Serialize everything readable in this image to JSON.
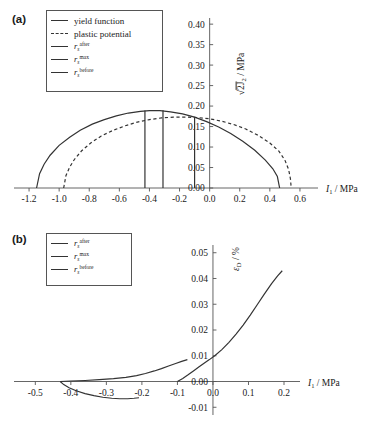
{
  "figure": {
    "panel_a_label": "(a)",
    "panel_b_label": "(b)"
  },
  "legend_a": {
    "items": [
      {
        "key": "solid",
        "type": "text",
        "label": "yield function"
      },
      {
        "key": "dashed",
        "type": "text",
        "label": "plastic potential"
      },
      {
        "key": "solid",
        "type": "symbol",
        "base": "r",
        "sub": "s",
        "sup": "after"
      },
      {
        "key": "solid",
        "type": "symbol",
        "base": "r",
        "sub": "s",
        "sup": "max"
      },
      {
        "key": "solid",
        "type": "symbol",
        "base": "r",
        "sub": "s",
        "sup": "before"
      }
    ]
  },
  "legend_b": {
    "items": [
      {
        "key": "solid",
        "type": "symbol",
        "base": "r",
        "sub": "s",
        "sup": "after"
      },
      {
        "key": "solid",
        "type": "symbol",
        "base": "r",
        "sub": "s",
        "sup": "max"
      },
      {
        "key": "solid",
        "type": "symbol",
        "base": "r",
        "sub": "s",
        "sup": "before"
      }
    ]
  },
  "chart_data": [
    {
      "id": "panel-a",
      "type": "line",
      "title": "",
      "xlabel": "I_1 / MPa",
      "ylabel": "sqrt(2 J_2) / MPa",
      "xlim": [
        -1.3,
        0.72
      ],
      "ylim": [
        0.0,
        0.415
      ],
      "xticks": [
        -1.2,
        -1.0,
        -0.8,
        -0.6,
        -0.4,
        -0.2,
        0.0,
        0.2,
        0.4,
        0.6
      ],
      "xticklabels": [
        "-1.2",
        "-1.0",
        "-0.8",
        "-0.6",
        "-0.4",
        "-0.2",
        "0.0",
        "0.2",
        "0.4",
        "0.6"
      ],
      "yticks": [
        0.0,
        0.05,
        0.1,
        0.15,
        0.2,
        0.25,
        0.3,
        0.35,
        0.4
      ],
      "yticklabels": [
        "0.00",
        "0.05",
        "0.10",
        "0.15",
        "0.20",
        "0.25",
        "0.30",
        "0.35",
        "0.40"
      ],
      "grid": false,
      "legend_position": "upper-left",
      "series": [
        {
          "name": "yield function",
          "style": "solid",
          "points": [
            [
              -1.15,
              0.0
            ],
            [
              -1.13,
              0.035
            ],
            [
              -1.1,
              0.058
            ],
            [
              -1.06,
              0.08
            ],
            [
              -1.0,
              0.104
            ],
            [
              -0.93,
              0.124
            ],
            [
              -0.86,
              0.141
            ],
            [
              -0.78,
              0.156
            ],
            [
              -0.7,
              0.167
            ],
            [
              -0.62,
              0.176
            ],
            [
              -0.54,
              0.183
            ],
            [
              -0.46,
              0.187
            ],
            [
              -0.4,
              0.189
            ],
            [
              -0.33,
              0.189
            ],
            [
              -0.26,
              0.186
            ],
            [
              -0.18,
              0.181
            ],
            [
              -0.1,
              0.173
            ],
            [
              -0.02,
              0.162
            ],
            [
              0.06,
              0.149
            ],
            [
              0.14,
              0.133
            ],
            [
              0.22,
              0.114
            ],
            [
              0.3,
              0.092
            ],
            [
              0.37,
              0.068
            ],
            [
              0.42,
              0.047
            ],
            [
              0.45,
              0.028
            ],
            [
              0.465,
              0.0
            ]
          ]
        },
        {
          "name": "plastic potential",
          "style": "dashed",
          "points": [
            [
              -0.97,
              0.0
            ],
            [
              -0.955,
              0.03
            ],
            [
              -0.93,
              0.051
            ],
            [
              -0.9,
              0.069
            ],
            [
              -0.85,
              0.091
            ],
            [
              -0.79,
              0.11
            ],
            [
              -0.72,
              0.127
            ],
            [
              -0.64,
              0.141
            ],
            [
              -0.56,
              0.152
            ],
            [
              -0.48,
              0.161
            ],
            [
              -0.4,
              0.167
            ],
            [
              -0.32,
              0.171
            ],
            [
              -0.24,
              0.173
            ],
            [
              -0.16,
              0.173
            ],
            [
              -0.08,
              0.172
            ],
            [
              0.0,
              0.169
            ],
            [
              0.08,
              0.163
            ],
            [
              0.16,
              0.155
            ],
            [
              0.24,
              0.144
            ],
            [
              0.32,
              0.129
            ],
            [
              0.4,
              0.11
            ],
            [
              0.46,
              0.09
            ],
            [
              0.5,
              0.068
            ],
            [
              0.525,
              0.045
            ],
            [
              0.537,
              0.022
            ],
            [
              0.542,
              0.0
            ]
          ]
        }
      ],
      "vertical_lines": [
        {
          "name": "r_s^after",
          "x": -0.43,
          "y_top": 0.189
        },
        {
          "name": "r_s^max",
          "x": -0.31,
          "y_top": 0.19
        },
        {
          "name": "r_s^before",
          "x": -0.1,
          "y_top": 0.172
        }
      ]
    },
    {
      "id": "panel-b",
      "type": "line",
      "title": "",
      "xlabel": "I_1 / MPa",
      "ylabel": "eps_D / %",
      "xlim": [
        -0.56,
        0.245
      ],
      "ylim": [
        -0.013,
        0.053
      ],
      "xticks": [
        -0.5,
        -0.4,
        -0.3,
        -0.2,
        -0.1,
        0.0,
        0.1,
        0.2
      ],
      "xticklabels": [
        "-0.5",
        "-0.4",
        "-0.3",
        "-0.2",
        "-0.1",
        "0.0",
        "0.1",
        "0.2"
      ],
      "yticks": [
        -0.01,
        0.0,
        0.01,
        0.02,
        0.03,
        0.04,
        0.05
      ],
      "yticklabels": [
        "-0.01",
        "0.00",
        "0.01",
        "0.02",
        "0.03",
        "0.04",
        "0.05"
      ],
      "grid": false,
      "legend_position": "upper-left",
      "series": [
        {
          "name": "r_s^after",
          "style": "solid",
          "points": [
            [
              -0.43,
              0.0
            ],
            [
              -0.42,
              -0.0012
            ],
            [
              -0.405,
              -0.0024
            ],
            [
              -0.385,
              -0.0036
            ],
            [
              -0.36,
              -0.0047
            ],
            [
              -0.335,
              -0.0055
            ],
            [
              -0.31,
              -0.0061
            ],
            [
              -0.285,
              -0.0065
            ],
            [
              -0.262,
              -0.0067
            ],
            [
              -0.24,
              -0.0067
            ],
            [
              -0.222,
              -0.0065
            ],
            [
              -0.208,
              -0.0063
            ]
          ]
        },
        {
          "name": "r_s^max",
          "style": "solid",
          "points": [
            [
              -0.43,
              0.0
            ],
            [
              -0.4,
              0.0002
            ],
            [
              -0.36,
              0.0004
            ],
            [
              -0.32,
              0.0007
            ],
            [
              -0.28,
              0.0011
            ],
            [
              -0.245,
              0.0016
            ],
            [
              -0.215,
              0.0023
            ],
            [
              -0.19,
              0.0031
            ],
            [
              -0.165,
              0.0041
            ],
            [
              -0.145,
              0.005
            ],
            [
              -0.125,
              0.006
            ],
            [
              -0.105,
              0.007
            ],
            [
              -0.088,
              0.0078
            ],
            [
              -0.072,
              0.0085
            ]
          ]
        },
        {
          "name": "r_s^before",
          "style": "solid",
          "points": [
            [
              -0.1,
              0.0
            ],
            [
              -0.085,
              0.0012
            ],
            [
              -0.07,
              0.0026
            ],
            [
              -0.055,
              0.0041
            ],
            [
              -0.04,
              0.0056
            ],
            [
              -0.025,
              0.0071
            ],
            [
              -0.01,
              0.0085
            ],
            [
              0.005,
              0.01
            ],
            [
              0.025,
              0.0124
            ],
            [
              0.045,
              0.0152
            ],
            [
              0.065,
              0.0184
            ],
            [
              0.085,
              0.0219
            ],
            [
              0.105,
              0.0258
            ],
            [
              0.125,
              0.0299
            ],
            [
              0.145,
              0.034
            ],
            [
              0.165,
              0.038
            ],
            [
              0.182,
              0.041
            ],
            [
              0.195,
              0.043
            ]
          ]
        }
      ]
    }
  ]
}
